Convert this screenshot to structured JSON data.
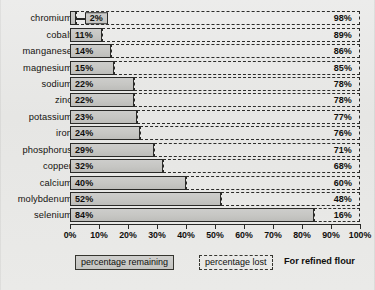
{
  "chart_data": {
    "type": "bar",
    "orientation": "horizontal",
    "stacked": true,
    "title": "",
    "note": "For refined flour",
    "xlabel": "",
    "ylabel": "",
    "xlim": [
      0,
      100
    ],
    "xticks": [
      "0%",
      "10%",
      "20%",
      "30%",
      "40%",
      "50%",
      "60%",
      "70%",
      "80%",
      "90%",
      "100%"
    ],
    "xtick_values": [
      0,
      10,
      20,
      30,
      40,
      50,
      60,
      70,
      80,
      90,
      100
    ],
    "grid": false,
    "legend_position": "bottom",
    "legend": [
      "percentage remaining",
      "percentage lost"
    ],
    "categories": [
      "chromium",
      "cobalt",
      "manganese",
      "magnesium",
      "sodium",
      "zinc",
      "potassium",
      "iron",
      "phosphorus",
      "copper",
      "calcium",
      "molybdenum",
      "selenium"
    ],
    "series": [
      {
        "name": "percentage remaining",
        "values": [
          2,
          11,
          14,
          15,
          22,
          22,
          23,
          24,
          29,
          32,
          40,
          52,
          84
        ],
        "labels": [
          "2%",
          "11%",
          "14%",
          "15%",
          "22%",
          "22%",
          "23%",
          "24%",
          "29%",
          "32%",
          "40%",
          "52%",
          "84%"
        ]
      },
      {
        "name": "percentage lost",
        "values": [
          98,
          89,
          86,
          85,
          78,
          78,
          77,
          76,
          71,
          68,
          60,
          48,
          16
        ],
        "labels": [
          "98%",
          "89%",
          "86%",
          "85%",
          "78%",
          "78%",
          "77%",
          "76%",
          "71%",
          "68%",
          "60%",
          "48%",
          "16%"
        ]
      }
    ],
    "rows": [
      {
        "category": "chromium",
        "remaining": 2,
        "remaining_label": "2%",
        "lost": 98,
        "lost_label": "98%",
        "callout": true
      },
      {
        "category": "cobalt",
        "remaining": 11,
        "remaining_label": "11%",
        "lost": 89,
        "lost_label": "89%",
        "callout": false
      },
      {
        "category": "manganese",
        "remaining": 14,
        "remaining_label": "14%",
        "lost": 86,
        "lost_label": "86%",
        "callout": false
      },
      {
        "category": "magnesium",
        "remaining": 15,
        "remaining_label": "15%",
        "lost": 85,
        "lost_label": "85%",
        "callout": false
      },
      {
        "category": "sodium",
        "remaining": 22,
        "remaining_label": "22%",
        "lost": 78,
        "lost_label": "78%",
        "callout": false
      },
      {
        "category": "zinc",
        "remaining": 22,
        "remaining_label": "22%",
        "lost": 78,
        "lost_label": "78%",
        "callout": false
      },
      {
        "category": "potassium",
        "remaining": 23,
        "remaining_label": "23%",
        "lost": 77,
        "lost_label": "77%",
        "callout": false
      },
      {
        "category": "iron",
        "remaining": 24,
        "remaining_label": "24%",
        "lost": 76,
        "lost_label": "76%",
        "callout": false
      },
      {
        "category": "phosphorus",
        "remaining": 29,
        "remaining_label": "29%",
        "lost": 71,
        "lost_label": "71%",
        "callout": false
      },
      {
        "category": "copper",
        "remaining": 32,
        "remaining_label": "32%",
        "lost": 68,
        "lost_label": "68%",
        "callout": false
      },
      {
        "category": "calcium",
        "remaining": 40,
        "remaining_label": "40%",
        "lost": 60,
        "lost_label": "60%",
        "callout": false
      },
      {
        "category": "molybdenum",
        "remaining": 52,
        "remaining_label": "52%",
        "lost": 48,
        "lost_label": "48%",
        "callout": false
      },
      {
        "category": "selenium",
        "remaining": 84,
        "remaining_label": "84%",
        "lost": 16,
        "lost_label": "16%",
        "callout": false
      }
    ],
    "colors": {
      "remaining_fill": "#c6c6c3",
      "remaining_stroke": "#2a2a28",
      "lost_stroke": "#2b2b29",
      "background": "#e8e8e6",
      "text": "#100f0d"
    }
  }
}
